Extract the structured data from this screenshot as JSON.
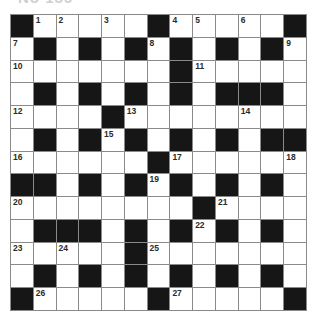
{
  "puzzle": {
    "title": "No 186",
    "rows": 13,
    "cols": 13,
    "grid": [
      "#....#....#",
      "placeholder"
    ],
    "layout": [
      [
        "#",
        "1",
        "2",
        ".",
        "3",
        ".",
        "#",
        "4",
        "5",
        ".",
        "6",
        ".",
        "#"
      ],
      [
        "7",
        "#",
        ".",
        "#",
        ".",
        "#",
        "8",
        "#",
        ".",
        "#",
        ".",
        "#",
        "9"
      ],
      [
        "10",
        ".",
        ".",
        ".",
        ".",
        ".",
        ".",
        "#",
        "11",
        ".",
        ".",
        ".",
        "."
      ],
      [
        ".",
        "#",
        ".",
        "#",
        ".",
        "#",
        ".",
        "#",
        ".",
        "#",
        "#",
        "#",
        "."
      ],
      [
        "12",
        ".",
        ".",
        ".",
        "#",
        "13",
        ".",
        ".",
        ".",
        ".",
        "14",
        ".",
        "."
      ],
      [
        ".",
        "#",
        ".",
        "#",
        "15",
        "#",
        ".",
        "#",
        ".",
        "#",
        ".",
        "#",
        "#"
      ],
      [
        "16",
        ".",
        ".",
        ".",
        ".",
        ".",
        "#",
        "17",
        ".",
        ".",
        ".",
        ".",
        "18"
      ],
      [
        "#",
        "#",
        ".",
        "#",
        ".",
        "#",
        "19",
        "#",
        ".",
        "#",
        ".",
        "#",
        "."
      ],
      [
        "20",
        ".",
        ".",
        ".",
        ".",
        ".",
        ".",
        ".",
        "#",
        "21",
        ".",
        ".",
        "."
      ],
      [
        ".",
        "#",
        "#",
        "#",
        ".",
        "#",
        ".",
        "#",
        "22",
        "#",
        ".",
        "#",
        "."
      ],
      [
        "23",
        ".",
        "24",
        ".",
        ".",
        "#",
        "25",
        ".",
        ".",
        ".",
        ".",
        ".",
        "."
      ],
      [
        ".",
        "#",
        ".",
        "#",
        ".",
        "#",
        ".",
        "#",
        ".",
        "#",
        ".",
        "#",
        "."
      ],
      [
        "#",
        "26",
        ".",
        ".",
        ".",
        ".",
        "#",
        "27",
        ".",
        ".",
        ".",
        ".",
        "#"
      ]
    ],
    "legend": {
      "#": "black square",
      ".": "empty white square",
      "number": "white square with clue number"
    }
  }
}
